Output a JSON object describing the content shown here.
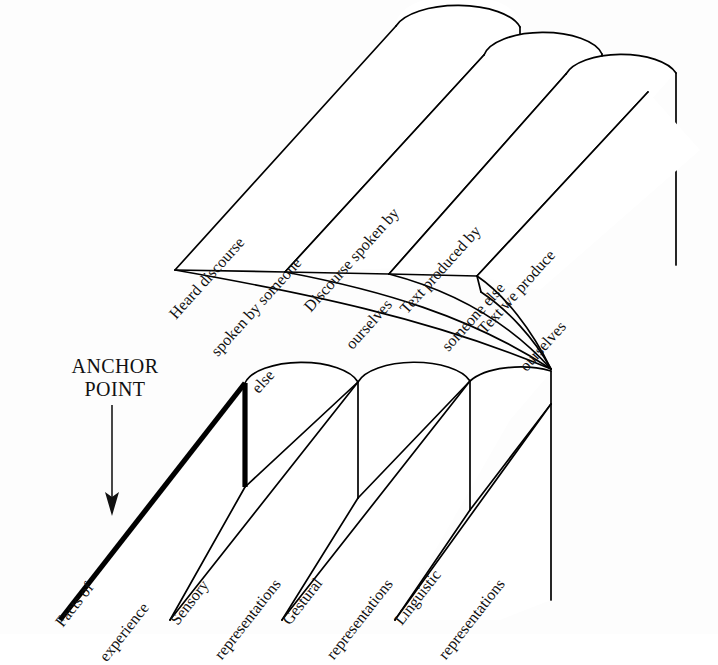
{
  "diagram": {
    "background_color": "#fdfdfd",
    "line_color": "#000000",
    "anchor": {
      "label_line1": "ANCHOR",
      "label_line2": "POINT",
      "arrow_name": "down-arrow"
    },
    "lower_plane": {
      "name": "representation-plane",
      "bands": [
        {
          "id": "facts-of-experience",
          "emphasis": "bold",
          "lines": [
            "Facts of",
            "experience"
          ]
        },
        {
          "id": "sensory-representations",
          "emphasis": "normal",
          "lines": [
            "Sensory",
            "representations"
          ]
        },
        {
          "id": "gestural-representations",
          "emphasis": "normal",
          "lines": [
            "Gestural",
            "representations"
          ]
        },
        {
          "id": "linguistic-representations",
          "emphasis": "normal",
          "lines": [
            "Linguistic",
            "representations"
          ]
        }
      ]
    },
    "upper_plane": {
      "name": "discourse-plane",
      "bands": [
        {
          "id": "heard-discourse-spoken-by-someone-else",
          "lines": [
            "Heard discourse",
            "spoken by someone",
            "else"
          ]
        },
        {
          "id": "discourse-spoken-by-ourselves",
          "lines": [
            "Discourse spoken by",
            "ourselves"
          ]
        },
        {
          "id": "text-produced-by-someone-else",
          "lines": [
            "Text produced by",
            "someone else"
          ]
        },
        {
          "id": "text-we-produce-ourselves",
          "lines": [
            "Text we produce",
            "ourselves"
          ]
        }
      ]
    }
  }
}
